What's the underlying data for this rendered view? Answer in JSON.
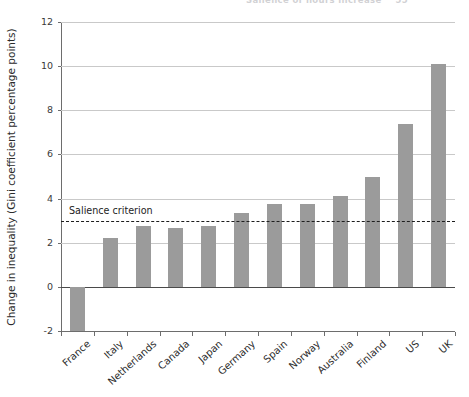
{
  "header": {
    "running_text": "Salience of hours increase",
    "page_number": "55"
  },
  "chart_data": {
    "type": "bar",
    "title": "",
    "xlabel": "",
    "ylabel": "Change in inequality (Gini coefficient percentage points)",
    "ylim": [
      -2,
      12
    ],
    "yticks": [
      -2,
      0,
      2,
      4,
      6,
      8,
      10,
      12
    ],
    "ytick_labels": [
      "-2",
      "0",
      "2",
      "4",
      "6",
      "8",
      "10",
      "12"
    ],
    "grid": true,
    "legend": "none",
    "bar_color": "#9b9b9b",
    "categories": [
      "France",
      "Italy",
      "Netherlands",
      "Canada",
      "Japan",
      "Germany",
      "Spain",
      "Norway",
      "Australia",
      "Finland",
      "US",
      "UK"
    ],
    "values": [
      -2.0,
      2.2,
      2.75,
      2.65,
      2.75,
      3.35,
      3.75,
      3.75,
      4.1,
      5.0,
      7.4,
      10.1
    ],
    "annotations": [
      {
        "name": "salience-criterion",
        "label": "Salience criterion",
        "type": "hline",
        "y": 3.0,
        "style": "dashed",
        "color": "#1d1d1d"
      }
    ]
  }
}
